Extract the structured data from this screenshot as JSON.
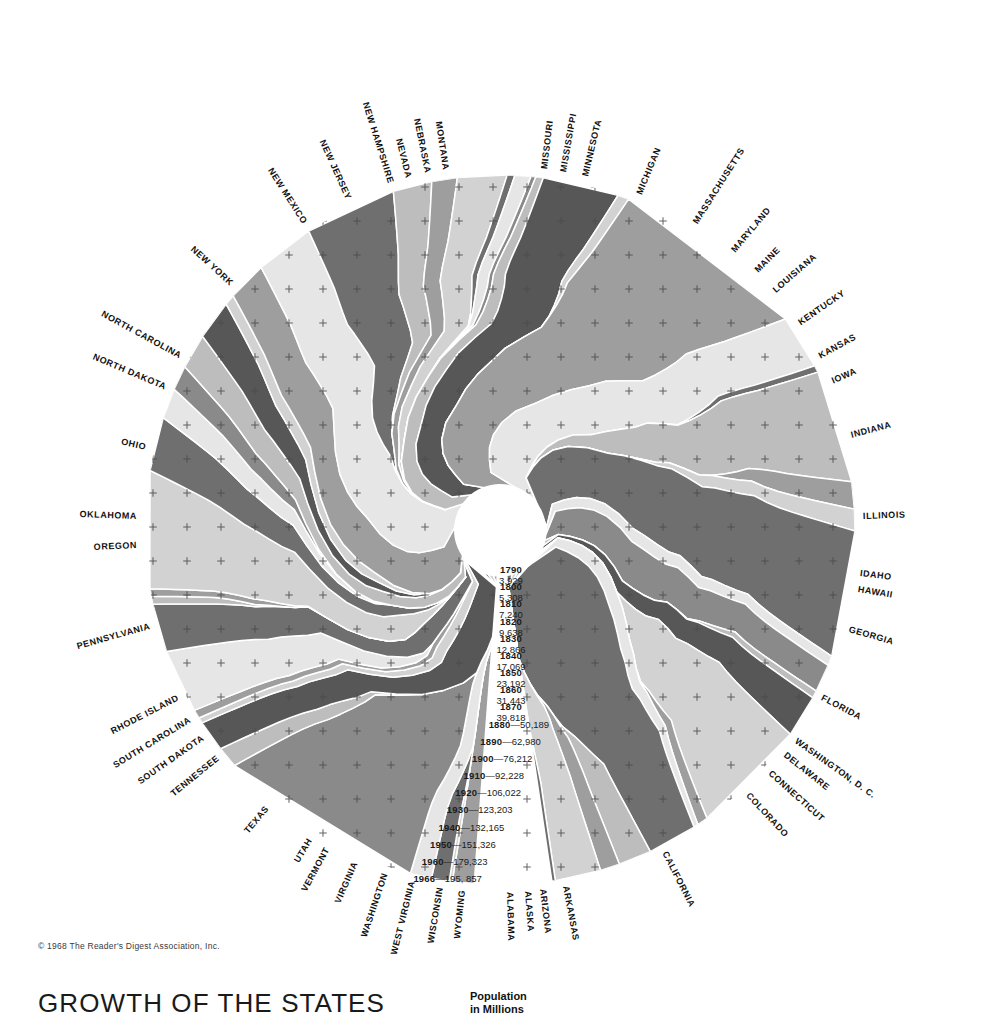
{
  "title": "GROWTH OF THE STATES",
  "copyright": "© 1968 The Reader's Digest Association, Inc.",
  "legend": {
    "caption_line1": "Population",
    "caption_line2": "in Millions"
  },
  "colors": {
    "background": "#ffffff",
    "ink": "#111111",
    "tone_lightest": "#e6e6e6",
    "tone_light": "#d2d2d2",
    "tone_mid_light": "#bdbdbd",
    "tone_mid": "#9e9e9e",
    "tone_mid_dark": "#8a8a8a",
    "tone_dark": "#6f6f6f",
    "tone_darkest": "#575757",
    "tick": "#4a4a4a"
  },
  "chart_data": {
    "type": "pie",
    "title": "GROWTH OF THE STATES",
    "subtitle": "Population in Millions",
    "legend_position": "center",
    "grid": true,
    "radial_axis_label": "Population in Millions",
    "radial_axis_ticks": [
      {
        "year": "1790",
        "value": "3,929",
        "population_thousands": 3929,
        "label_style": "stacked"
      },
      {
        "year": "1800",
        "value": "5,308",
        "population_thousands": 5308,
        "label_style": "stacked"
      },
      {
        "year": "1810",
        "value": "7,240",
        "population_thousands": 7240,
        "label_style": "stacked"
      },
      {
        "year": "1820",
        "value": "9,638",
        "population_thousands": 9638,
        "label_style": "stacked"
      },
      {
        "year": "1830",
        "value": "12,866",
        "population_thousands": 12866,
        "label_style": "stacked"
      },
      {
        "year": "1840",
        "value": "17,069",
        "population_thousands": 17069,
        "label_style": "stacked"
      },
      {
        "year": "1850",
        "value": "23,192",
        "population_thousands": 23192,
        "label_style": "stacked"
      },
      {
        "year": "1860",
        "value": "31,443",
        "population_thousands": 31443,
        "label_style": "stacked"
      },
      {
        "year": "1870",
        "value": "39,818",
        "population_thousands": 39818,
        "label_style": "stacked"
      },
      {
        "year": "1880",
        "value": "50,189",
        "population_thousands": 50189,
        "label_style": "inline"
      },
      {
        "year": "1890",
        "value": "62,980",
        "population_thousands": 62980,
        "label_style": "inline"
      },
      {
        "year": "1900",
        "value": "76,212",
        "population_thousands": 76212,
        "label_style": "inline"
      },
      {
        "year": "1910",
        "value": "92,228",
        "population_thousands": 92228,
        "label_style": "inline"
      },
      {
        "year": "1920",
        "value": "106,022",
        "population_thousands": 106022,
        "label_style": "inline"
      },
      {
        "year": "1930",
        "value": "123,203",
        "population_thousands": 123203,
        "label_style": "inline"
      },
      {
        "year": "1940",
        "value": "132,165",
        "population_thousands": 132165,
        "label_style": "inline"
      },
      {
        "year": "1950",
        "value": "151,326",
        "population_thousands": 151326,
        "label_style": "inline"
      },
      {
        "year": "1960",
        "value": "179,323",
        "population_thousands": 179323,
        "label_style": "inline"
      },
      {
        "year": "1966",
        "value": "195, 857",
        "population_thousands": 195857,
        "label_style": "inline"
      }
    ],
    "categories": [
      "ALABAMA",
      "ALASKA",
      "ARIZONA",
      "ARKANSAS",
      "CALIFORNIA",
      "COLORADO",
      "CONNECTICUT",
      "DELAWARE",
      "WASHINGTON, D. C.",
      "FLORIDA",
      "GEORGIA",
      "HAWAII",
      "IDAHO",
      "ILLINOIS",
      "INDIANA",
      "IOWA",
      "KANSAS",
      "KENTUCKY",
      "LOUISIANA",
      "MAINE",
      "MARYLAND",
      "MASSACHUSETTS",
      "MICHIGAN",
      "MINNESOTA",
      "MISSISSIPPI",
      "MISSOURI",
      "MONTANA",
      "NEBRASKA",
      "NEVADA",
      "NEW HAMPSHIRE",
      "NEW JERSEY",
      "NEW MEXICO",
      "NEW YORK",
      "NORTH CAROLINA",
      "NORTH DAKOTA",
      "OHIO",
      "OKLAHOMA",
      "OREGON",
      "PENNSYLVANIA",
      "RHODE ISLAND",
      "SOUTH CAROLINA",
      "SOUTH DAKOTA",
      "TENNESSEE",
      "TEXAS",
      "UTAH",
      "VERMONT",
      "VIRGINIA",
      "WASHINGTON",
      "WEST VIRGINIA",
      "WISCONSIN",
      "WYOMING"
    ],
    "values": [
      3.44,
      0.27,
      1.63,
      1.95,
      18.92,
      1.98,
      2.87,
      0.52,
      0.8,
      5.9,
      4.45,
      0.72,
      0.7,
      10.73,
      4.92,
      2.76,
      2.24,
      3.19,
      3.61,
      0.98,
      3.6,
      5.42,
      8.47,
      3.58,
      2.34,
      4.51,
      0.7,
      1.46,
      0.44,
      0.68,
      6.95,
      1.01,
      18.07,
      5.0,
      0.64,
      10.41,
      2.48,
      1.97,
      11.58,
      0.89,
      2.56,
      0.68,
      3.87,
      10.75,
      1.0,
      0.41,
      4.53,
      3.02,
      1.79,
      4.19,
      0.32
    ],
    "value_unit": "millions (1966)",
    "total": 195.857
  },
  "labels": [
    {
      "name": "MISSOURI",
      "angle": -83.0
    },
    {
      "name": "MISSISSIPPI",
      "angle": -80.0
    },
    {
      "name": "MINNESOTA",
      "angle": -76.5
    },
    {
      "name": "MICHIGAN",
      "angle": -67.5
    },
    {
      "name": "MASSACHUSETTS",
      "angle": -57.5
    },
    {
      "name": "MARYLAND",
      "angle": -50.0
    },
    {
      "name": "MAINE",
      "angle": -45.2
    },
    {
      "name": "LOUISIANA",
      "angle": -41.0
    },
    {
      "name": "KENTUCKY",
      "angle": -34.5
    },
    {
      "name": "KANSAS",
      "angle": -28.5
    },
    {
      "name": "IOWA",
      "angle": -24.0
    },
    {
      "name": "INDIANA",
      "angle": -15.0
    },
    {
      "name": "ILLINOIS",
      "angle": -2.0
    },
    {
      "name": "IDAHO",
      "angle": 7.0
    },
    {
      "name": "HAWAII",
      "angle": 9.5
    },
    {
      "name": "GEORGIA",
      "angle": 16.0
    },
    {
      "name": "FLORIDA",
      "angle": 27.5
    },
    {
      "name": "WASHINGTON, D. C.",
      "angle": 35.5
    },
    {
      "name": "DELAWARE",
      "angle": 38.3
    },
    {
      "name": "CONNECTICUT",
      "angle": 42.0
    },
    {
      "name": "COLORADO",
      "angle": 47.0
    },
    {
      "name": "CALIFORNIA",
      "angle": 63.0
    },
    {
      "name": "ARKANSAS",
      "angle": 79.5
    },
    {
      "name": "ARIZONA",
      "angle": 83.2
    },
    {
      "name": "ALASKA",
      "angle": 85.6
    },
    {
      "name": "ALABAMA",
      "angle": 88.5
    },
    {
      "name": "WYOMING",
      "angle": 96.0
    },
    {
      "name": "WISCONSIN",
      "angle": 99.5
    },
    {
      "name": "WEST VIRGINIA",
      "angle": 104.0
    },
    {
      "name": "WASHINGTON",
      "angle": 108.5
    },
    {
      "name": "VIRGINIA",
      "angle": 113.5
    },
    {
      "name": "VERMONT",
      "angle": 118.5
    },
    {
      "name": "UTAH",
      "angle": 121.5
    },
    {
      "name": "TEXAS",
      "angle": 130.0
    },
    {
      "name": "TENNESSEE",
      "angle": 141.0
    },
    {
      "name": "SOUTH DAKOTA",
      "angle": 145.0
    },
    {
      "name": "SOUTH CAROLINA",
      "angle": 148.5
    },
    {
      "name": "RHODE ISLAND",
      "angle": 152.5
    },
    {
      "name": "PENNSYLVANIA",
      "angle": 164.5
    },
    {
      "name": "OREGON",
      "angle": 177.5
    },
    {
      "name": "OKLAHOMA",
      "angle": 182.0
    },
    {
      "name": "OHIO",
      "angle": 193.0
    },
    {
      "name": "NORTH DAKOTA",
      "angle": 203.0
    },
    {
      "name": "NORTH CAROLINA",
      "angle": 208.5
    },
    {
      "name": "NEW YORK",
      "angle": 222.5
    },
    {
      "name": "NEW MEXICO",
      "angle": 237.5
    },
    {
      "name": "NEW JERSEY",
      "angle": 245.5
    },
    {
      "name": "NEW HAMPSHIRE",
      "angle": 252.5
    },
    {
      "name": "NEVADA",
      "angle": 255.5
    },
    {
      "name": "NEBRASKA",
      "angle": 258.5
    },
    {
      "name": "MONTANA",
      "angle": 261.5
    }
  ]
}
